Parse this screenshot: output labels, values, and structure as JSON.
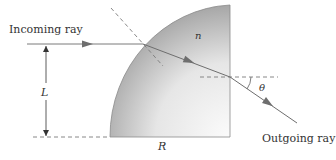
{
  "diagram": {
    "labels": {
      "incoming": "Incoming ray",
      "outgoing": "Outgoing ray",
      "index": "n",
      "height": "L",
      "radius": "R",
      "angle": "θ"
    },
    "colors": {
      "ray": "#6e6e6e",
      "dashed": "#7a7a7a",
      "body_dark": "#9a9a9a",
      "body_light": "#fafafa",
      "text": "#333333"
    }
  }
}
